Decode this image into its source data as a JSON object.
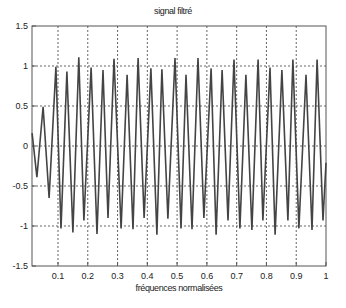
{
  "chart_data": {
    "type": "line",
    "title": "signal filtré",
    "xlabel": "fréquences normalisées",
    "ylabel": "",
    "xlim": [
      0.0127,
      1.0
    ],
    "ylim": [
      -1.5,
      1.5
    ],
    "grid": true,
    "legend": null,
    "xticks": [
      0.1,
      0.2,
      0.3,
      0.4,
      0.5,
      0.6,
      0.7,
      0.8,
      0.9,
      1
    ],
    "xtick_labels": [
      "0.1",
      "0.2",
      "0.3",
      "0.4",
      "0.5",
      "0.6",
      "0.7",
      "0.8",
      "0.9",
      "1"
    ],
    "yticks": [
      1.5,
      1,
      0.5,
      0,
      -0.5,
      -1,
      -1.5
    ],
    "ytick_labels": [
      "1.5",
      "1",
      "0.5",
      "0",
      "-0.5",
      "-1",
      "-1.5"
    ],
    "series": [
      {
        "name": "signal filtré",
        "color": "#444444",
        "x": [
          0.013,
          0.029,
          0.05,
          0.07,
          0.093,
          0.11,
          0.13,
          0.15,
          0.17,
          0.187,
          0.211,
          0.231,
          0.251,
          0.268,
          0.288,
          0.312,
          0.332,
          0.352,
          0.369,
          0.389,
          0.412,
          0.432,
          0.449,
          0.469,
          0.493,
          0.513,
          0.53,
          0.55,
          0.57,
          0.59,
          0.614,
          0.631,
          0.651,
          0.671,
          0.691,
          0.711,
          0.731,
          0.751,
          0.772,
          0.788,
          0.812,
          0.829,
          0.852,
          0.872,
          0.889,
          0.909,
          0.933,
          0.953,
          0.97,
          0.99,
          1.0
        ],
        "y": [
          0.16,
          -0.39,
          0.49,
          -0.65,
          0.99,
          -1.03,
          0.93,
          -1.08,
          1.11,
          -0.93,
          0.98,
          -1.1,
          0.95,
          -0.9,
          1.09,
          -1.03,
          0.89,
          -1.04,
          1.1,
          -0.9,
          0.97,
          -1.11,
          0.96,
          -0.91,
          1.1,
          -1.03,
          0.89,
          -1.04,
          1.1,
          -0.9,
          0.97,
          -1.11,
          0.95,
          -0.93,
          1.08,
          -1.03,
          0.89,
          -1.05,
          1.08,
          -0.93,
          0.98,
          -1.11,
          0.95,
          -0.93,
          1.08,
          -1.03,
          0.89,
          -1.05,
          1.08,
          -0.93,
          -0.21
        ]
      }
    ]
  }
}
